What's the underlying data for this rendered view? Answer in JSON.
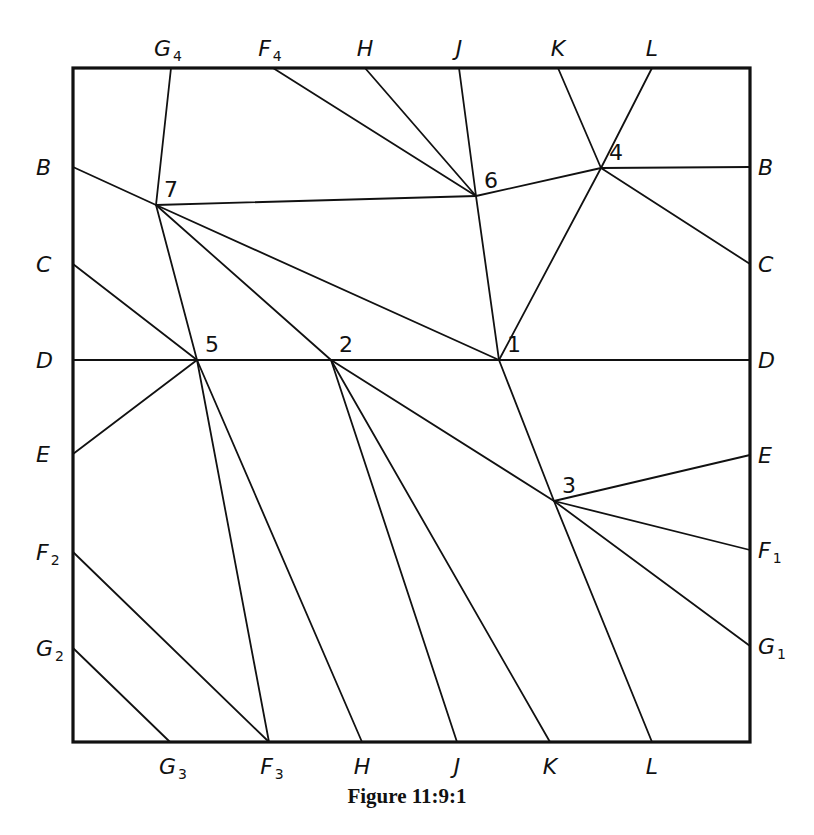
{
  "figure": {
    "caption": "Figure 11:9:1",
    "frame": {
      "left": 73,
      "top": 68,
      "right": 750,
      "bottom": 742
    },
    "border_labels": {
      "top": [
        {
          "t": "G",
          "s": "4",
          "x": 171
        },
        {
          "t": "F",
          "s": "4",
          "x": 273
        },
        {
          "t": "H",
          "s": "",
          "x": 365
        },
        {
          "t": "J",
          "s": "",
          "x": 459
        },
        {
          "t": "K",
          "s": "",
          "x": 558
        },
        {
          "t": "L",
          "s": "",
          "x": 652
        }
      ],
      "bottom": [
        {
          "t": "G",
          "s": "3",
          "x": 170
        },
        {
          "t": "F",
          "s": "3",
          "x": 269
        },
        {
          "t": "H",
          "s": "",
          "x": 362
        },
        {
          "t": "J",
          "s": "",
          "x": 457
        },
        {
          "t": "K",
          "s": "",
          "x": 550
        },
        {
          "t": "L",
          "s": "",
          "x": 652
        }
      ],
      "left": [
        {
          "t": "B",
          "s": "",
          "y": 167
        },
        {
          "t": "C",
          "s": "",
          "y": 264
        },
        {
          "t": "D",
          "s": "",
          "y": 360
        },
        {
          "t": "E",
          "s": "",
          "y": 454
        },
        {
          "t": "F",
          "s": "2",
          "y": 552
        },
        {
          "t": "G",
          "s": "2",
          "y": 648
        }
      ],
      "right": [
        {
          "t": "B",
          "s": "",
          "y": 167
        },
        {
          "t": "C",
          "s": "",
          "y": 264
        },
        {
          "t": "D",
          "s": "",
          "y": 360
        },
        {
          "t": "E",
          "s": "",
          "y": 455
        },
        {
          "t": "F",
          "s": "1",
          "y": 550
        },
        {
          "t": "G",
          "s": "1",
          "y": 646
        }
      ]
    },
    "vertices": [
      {
        "id": "1",
        "x": 499,
        "y": 360
      },
      {
        "id": "2",
        "x": 331,
        "y": 360
      },
      {
        "id": "3",
        "x": 554,
        "y": 501
      },
      {
        "id": "4",
        "x": 601,
        "y": 168
      },
      {
        "id": "5",
        "x": 197,
        "y": 360
      },
      {
        "id": "6",
        "x": 476,
        "y": 196
      },
      {
        "id": "7",
        "x": 156,
        "y": 205
      }
    ],
    "edges": [
      [
        "T:G4",
        "7"
      ],
      [
        "L:B",
        "7"
      ],
      [
        "7",
        "6"
      ],
      [
        "7",
        "5"
      ],
      [
        "7",
        "2"
      ],
      [
        "7",
        "1"
      ],
      [
        "T:F4",
        "6"
      ],
      [
        "T:H",
        "6"
      ],
      [
        "T:J",
        "6"
      ],
      [
        "6",
        "4"
      ],
      [
        "6",
        "1"
      ],
      [
        "T:K",
        "4"
      ],
      [
        "T:L",
        "4"
      ],
      [
        "4",
        "R:B"
      ],
      [
        "4",
        "R:C"
      ],
      [
        "4",
        "1"
      ],
      [
        "L:C",
        "5"
      ],
      [
        "L:D",
        "R:D"
      ],
      [
        "L:E",
        "5"
      ],
      [
        "5",
        "B:F3"
      ],
      [
        "5",
        "B:H"
      ],
      [
        "2",
        "B:J"
      ],
      [
        "2",
        "B:K"
      ],
      [
        "2",
        "3"
      ],
      [
        "1",
        "3"
      ],
      [
        "3",
        "R:E"
      ],
      [
        "3",
        "R:F1"
      ],
      [
        "3",
        "R:G1"
      ],
      [
        "3",
        "B:L"
      ],
      [
        "L:F2",
        "B:F3"
      ],
      [
        "L:G2",
        "B:G3"
      ]
    ]
  }
}
